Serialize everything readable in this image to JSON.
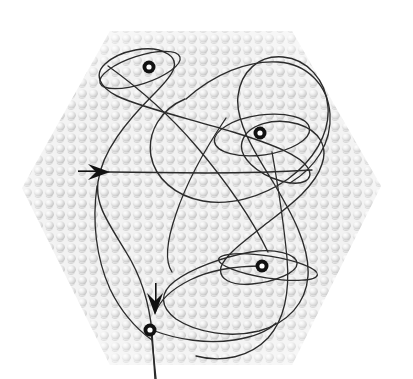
{
  "figure": {
    "kind": "diagram",
    "canvas": {
      "width": 413,
      "height": 379,
      "background": "#ffffff"
    },
    "substrate": {
      "name": "hexagonal-dot-texture-panel",
      "shape": "hexagon",
      "vertices": [
        [
          110,
          31
        ],
        [
          292,
          31
        ],
        [
          381,
          186
        ],
        [
          292,
          365
        ],
        [
          110,
          365
        ],
        [
          22,
          188
        ]
      ],
      "fill": "#f3f3f3",
      "dot_color": "#d6d6d6",
      "dot_highlight": "#ffffff",
      "dot_shadow": "#bdbdbd",
      "dot_spacing_px": 11,
      "dot_radius_px": 4
    },
    "curve": {
      "name": "trajectory-curve",
      "stroke": "#2b2b2b",
      "stroke_width_px": 1.4,
      "fill": "none",
      "description": "single continuous self-intersecting open curve with four small loops",
      "path": "M 155 379 L 152 330 C 150 300 143 276 128 252 C 110 222 96 205 98 183 C 101 152 126 122 152 95 C 171 75 181 63 168 54 C 152 43 120 51 106 63 C 95 73 99 86 116 95 C 140 107 190 118 232 131 C 274 144 300 155 307 167 C 314 179 302 186 281 180 C 258 173 239 156 242 142 C 246 125 274 118 297 125 C 318 131 326 146 321 163 C 315 186 289 205 268 222 C 243 242 226 254 222 266 C 219 278 231 285 252 283 C 274 281 296 271 296 262 C 296 253 276 247 252 251 C 223 256 192 268 176 280 C 160 292 160 306 176 318 C 196 332 230 337 258 330 C 287 322 305 303 307 275 C 309 245 291 212 273 182 C 253 150 236 120 238 96 C 240 72 258 56 282 58 C 306 60 325 80 327 106 C 329 133 313 160 288 178 C 263 196 231 205 204 200 C 176 195 156 177 152 155 C 148 131 162 108 186 99"
    },
    "markers": [
      {
        "name": "node-marker-1",
        "cx": 149,
        "cy": 67,
        "r_outer": 6.5,
        "r_inner": 2.6,
        "ring_color": "#111111",
        "hole_color": "#ffffff"
      },
      {
        "name": "node-marker-2",
        "cx": 260,
        "cy": 133,
        "r_outer": 6.5,
        "r_inner": 2.6,
        "ring_color": "#111111",
        "hole_color": "#ffffff"
      },
      {
        "name": "node-marker-3",
        "cx": 262,
        "cy": 266,
        "r_outer": 6.5,
        "r_inner": 2.6,
        "ring_color": "#111111",
        "hole_color": "#ffffff"
      },
      {
        "name": "node-marker-4",
        "cx": 150,
        "cy": 330,
        "r_outer": 6.5,
        "r_inner": 2.6,
        "ring_color": "#111111",
        "hole_color": "#ffffff"
      }
    ],
    "loops": [
      {
        "name": "loop-top-left",
        "cx": 140,
        "cy": 70,
        "rx": 42,
        "ry": 14,
        "rotation_deg": -18
      },
      {
        "name": "loop-middle",
        "cx": 262,
        "cy": 135,
        "rx": 48,
        "ry": 20,
        "rotation_deg": -8
      },
      {
        "name": "loop-lower-right",
        "cx": 268,
        "cy": 267,
        "rx": 50,
        "ry": 11,
        "rotation_deg": 9
      }
    ],
    "arrows": [
      {
        "name": "direction-arrow-left",
        "direction": "right",
        "tip": [
          110,
          172
        ],
        "tail": [
          78,
          172
        ],
        "color": "#111111",
        "length_px": 32,
        "head_width_px": 16
      },
      {
        "name": "direction-arrow-bottom",
        "direction": "down",
        "tip": [
          155,
          315
        ],
        "tail": [
          155,
          283
        ],
        "color": "#111111",
        "length_px": 32,
        "head_width_px": 16
      }
    ]
  }
}
